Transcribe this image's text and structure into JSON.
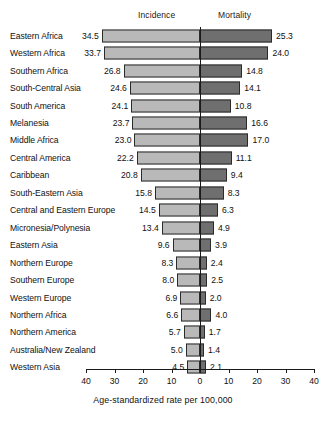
{
  "figure": {
    "headers": {
      "incidence": "Incidence",
      "mortality": "Mortality"
    },
    "x_axis_title": "Age-standardized rate per 100,000",
    "tick_labels": [
      "40",
      "30",
      "20",
      "10",
      "0",
      "10",
      "20",
      "30",
      "40"
    ]
  },
  "chart_data": {
    "type": "bar",
    "orientation": "horizontal-diverging",
    "title": "",
    "subtitle": "",
    "xlabel": "Age-standardized rate per 100,000",
    "ylabel": "",
    "xlim": [
      -40,
      40
    ],
    "xticks": [
      -40,
      -30,
      -20,
      -10,
      0,
      10,
      20,
      30,
      40
    ],
    "xticklabels": [
      "40",
      "30",
      "20",
      "10",
      "0",
      "10",
      "20",
      "30",
      "40"
    ],
    "grid": false,
    "legend_position": "top",
    "categories": [
      "Eastern Africa",
      "Western Africa",
      "Southern Africa",
      "South-Central Asia",
      "South America",
      "Melanesia",
      "Middle Africa",
      "Central America",
      "Caribbean",
      "South-Eastern Asia",
      "Central and Eastern Europe",
      "Micronesia/Polynesia",
      "Eastern Asia",
      "Northern Europe",
      "Southern Europe",
      "Western Europe",
      "Northern Africa",
      "Northern America",
      "Australia/New Zealand",
      "Western Asia"
    ],
    "series": [
      {
        "name": "Incidence",
        "side": "left",
        "color": "#b9b9b9",
        "values": [
          34.5,
          33.7,
          26.8,
          24.6,
          24.1,
          23.7,
          23.0,
          22.2,
          20.8,
          15.8,
          14.5,
          13.4,
          9.6,
          8.3,
          8.0,
          6.9,
          6.6,
          5.7,
          5.0,
          4.5
        ],
        "labels": [
          "34.5",
          "33.7",
          "26.8",
          "24.6",
          "24.1",
          "23.7",
          "23.0",
          "22.2",
          "20.8",
          "15.8",
          "14.5",
          "13.4",
          "9.6",
          "8.3",
          "8.0",
          "6.9",
          "6.6",
          "5.7",
          "5.0",
          "4.5"
        ]
      },
      {
        "name": "Mortality",
        "side": "right",
        "color": "#6f6f6f",
        "values": [
          25.3,
          24.0,
          14.8,
          14.1,
          10.8,
          16.6,
          17.0,
          11.1,
          9.4,
          8.3,
          6.3,
          4.9,
          3.9,
          2.4,
          2.5,
          2.0,
          4.0,
          1.7,
          1.4,
          2.1
        ],
        "labels": [
          "25.3",
          "24.0",
          "14.8",
          "14.1",
          "10.8",
          "16.6",
          "17.0",
          "11.1",
          "9.4",
          "8.3",
          "6.3",
          "4.9",
          "3.9",
          "2.4",
          "2.5",
          "2.0",
          "4.0",
          "1.7",
          "1.4",
          "2.1"
        ]
      }
    ]
  }
}
